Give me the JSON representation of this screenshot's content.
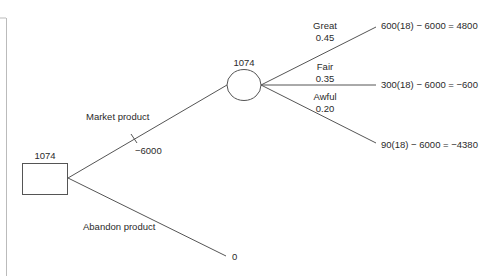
{
  "diagram": {
    "type": "decision-tree",
    "decision_node": {
      "value": "1074"
    },
    "chance_node": {
      "value": "1074"
    },
    "decision_branches": [
      {
        "label": "Market product",
        "cost": "−6000"
      },
      {
        "label": "Abandon product",
        "payoff": "0"
      }
    ],
    "chance_branches": [
      {
        "label": "Great",
        "probability": "0.45",
        "payoff": "600(18) − 6000 = 4800"
      },
      {
        "label": "Fair",
        "probability": "0.35",
        "payoff": "300(18) − 6000 = −600"
      },
      {
        "label": "Awful",
        "probability": "0.20",
        "payoff": "90(18) − 6000 = −4380"
      }
    ],
    "colors": {
      "line": "#555555",
      "text": "#2a2a2a",
      "background": "#ffffff"
    }
  }
}
